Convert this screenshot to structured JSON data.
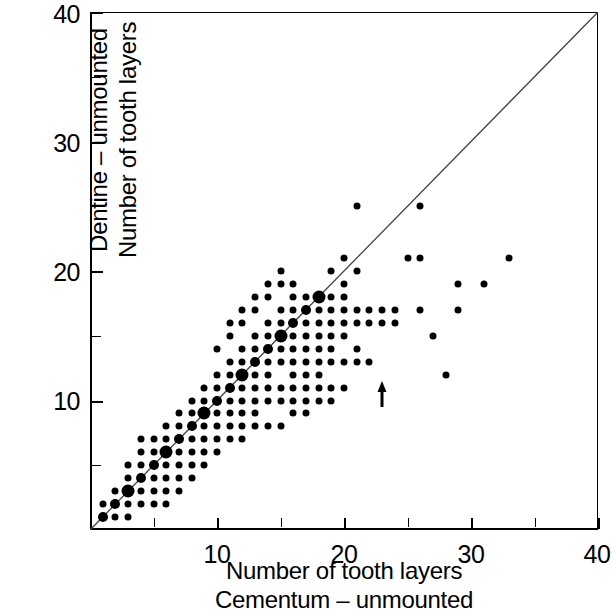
{
  "chart_data": {
    "type": "scatter",
    "title": "",
    "xlabel": "Number of tooth layers / Cementum - unmounted",
    "ylabel": "Dentine - unmounted / Number of tooth layers",
    "xlim": [
      0,
      40
    ],
    "ylim": [
      0,
      40
    ],
    "grid": false,
    "legend": null,
    "x_tick_labels": [
      "10",
      "20",
      "30",
      "40"
    ],
    "x_tick_values": [
      10,
      20,
      30,
      40
    ],
    "y_tick_labels": [
      "10",
      "20",
      "30",
      "40"
    ],
    "y_tick_values": [
      10,
      20,
      30,
      40
    ],
    "minor_tick_interval": 5,
    "reference_line": {
      "name": "identity-line",
      "type": "line",
      "from": [
        0,
        0
      ],
      "to": [
        40,
        40
      ],
      "color": "#444444"
    },
    "annotations": [
      {
        "name": "censored-arrow",
        "symbol": "up-arrow",
        "x": 23,
        "y": 10.5
      }
    ],
    "point_color": "#000000",
    "points": [
      [
        1,
        1
      ],
      [
        1,
        2
      ],
      [
        2,
        1
      ],
      [
        2,
        2
      ],
      [
        2,
        3
      ],
      [
        3,
        2
      ],
      [
        3,
        3
      ],
      [
        3,
        4
      ],
      [
        4,
        3
      ],
      [
        4,
        4
      ],
      [
        4,
        5
      ],
      [
        5,
        4
      ],
      [
        5,
        5
      ],
      [
        5,
        6
      ],
      [
        5,
        3
      ],
      [
        6,
        5
      ],
      [
        6,
        6
      ],
      [
        6,
        7
      ],
      [
        6,
        4
      ],
      [
        7,
        6
      ],
      [
        7,
        7
      ],
      [
        7,
        8
      ],
      [
        7,
        5
      ],
      [
        8,
        7
      ],
      [
        8,
        8
      ],
      [
        8,
        9
      ],
      [
        8,
        6
      ],
      [
        9,
        8
      ],
      [
        9,
        9
      ],
      [
        9,
        10
      ],
      [
        9,
        7
      ],
      [
        10,
        9
      ],
      [
        10,
        10
      ],
      [
        10,
        11
      ],
      [
        10,
        8
      ],
      [
        11,
        10
      ],
      [
        11,
        11
      ],
      [
        11,
        12
      ],
      [
        11,
        9
      ],
      [
        12,
        11
      ],
      [
        12,
        12
      ],
      [
        12,
        13
      ],
      [
        12,
        10
      ],
      [
        13,
        12
      ],
      [
        13,
        13
      ],
      [
        13,
        14
      ],
      [
        13,
        11
      ],
      [
        14,
        13
      ],
      [
        14,
        14
      ],
      [
        14,
        15
      ],
      [
        14,
        12
      ],
      [
        15,
        14
      ],
      [
        15,
        15
      ],
      [
        15,
        16
      ],
      [
        15,
        13
      ],
      [
        16,
        15
      ],
      [
        16,
        16
      ],
      [
        16,
        17
      ],
      [
        16,
        14
      ],
      [
        17,
        16
      ],
      [
        17,
        17
      ],
      [
        17,
        18
      ],
      [
        17,
        15
      ],
      [
        18,
        17
      ],
      [
        18,
        18
      ],
      [
        18,
        16
      ],
      [
        19,
        18
      ],
      [
        19,
        17
      ],
      [
        20,
        19
      ],
      [
        20,
        18
      ],
      [
        21,
        20
      ],
      [
        21,
        25
      ],
      [
        22,
        17
      ],
      [
        23,
        17
      ],
      [
        24,
        17
      ],
      [
        25,
        21
      ],
      [
        26,
        25
      ],
      [
        26,
        17
      ],
      [
        26,
        21
      ],
      [
        27,
        15
      ],
      [
        28,
        12
      ],
      [
        29,
        19
      ],
      [
        29,
        17
      ],
      [
        33,
        21
      ],
      [
        31,
        19
      ],
      [
        4,
        6
      ],
      [
        5,
        7
      ],
      [
        6,
        8
      ],
      [
        7,
        9
      ],
      [
        8,
        10
      ],
      [
        9,
        11
      ],
      [
        10,
        12
      ],
      [
        11,
        13
      ],
      [
        12,
        14
      ],
      [
        13,
        15
      ],
      [
        14,
        16
      ],
      [
        15,
        17
      ],
      [
        16,
        18
      ],
      [
        12,
        16
      ],
      [
        13,
        17
      ],
      [
        14,
        18
      ],
      [
        15,
        19
      ],
      [
        11,
        15
      ],
      [
        10,
        14
      ],
      [
        13,
        9
      ],
      [
        14,
        10
      ],
      [
        15,
        11
      ],
      [
        16,
        12
      ],
      [
        17,
        13
      ],
      [
        18,
        14
      ],
      [
        12,
        8
      ],
      [
        16,
        11
      ],
      [
        17,
        11
      ],
      [
        18,
        11
      ],
      [
        19,
        11
      ],
      [
        20,
        11
      ],
      [
        15,
        10
      ],
      [
        16,
        10
      ],
      [
        17,
        10
      ],
      [
        18,
        10
      ],
      [
        19,
        10
      ],
      [
        12,
        9
      ],
      [
        13,
        10
      ],
      [
        14,
        11
      ],
      [
        9,
        6
      ],
      [
        10,
        7
      ],
      [
        11,
        8
      ],
      [
        6,
        3
      ],
      [
        7,
        4
      ],
      [
        8,
        5
      ],
      [
        3,
        5
      ],
      [
        4,
        7
      ],
      [
        18,
        13
      ],
      [
        19,
        13
      ],
      [
        20,
        13
      ],
      [
        21,
        13
      ],
      [
        16,
        13
      ],
      [
        17,
        14
      ],
      [
        18,
        15
      ],
      [
        19,
        16
      ],
      [
        20,
        17
      ],
      [
        21,
        17
      ],
      [
        22,
        13
      ],
      [
        20,
        15
      ],
      [
        19,
        15
      ],
      [
        18,
        12
      ],
      [
        17,
        12
      ],
      [
        16,
        19
      ],
      [
        15,
        20
      ],
      [
        14,
        19
      ],
      [
        13,
        18
      ],
      [
        12,
        17
      ],
      [
        11,
        16
      ],
      [
        20,
        21
      ],
      [
        19,
        20
      ],
      [
        21,
        16
      ],
      [
        22,
        16
      ],
      [
        23,
        16
      ],
      [
        24,
        16
      ],
      [
        14,
        8
      ],
      [
        15,
        8
      ],
      [
        13,
        8
      ],
      [
        17,
        9
      ],
      [
        16,
        9
      ],
      [
        12,
        7
      ],
      [
        11,
        7
      ],
      [
        10,
        6
      ],
      [
        8,
        4
      ],
      [
        9,
        5
      ],
      [
        7,
        3
      ],
      [
        5,
        2
      ],
      [
        6,
        2
      ],
      [
        4,
        2
      ],
      [
        3,
        1
      ],
      [
        20,
        16
      ],
      [
        19,
        14
      ],
      [
        21,
        14
      ]
    ]
  },
  "axis_titles": {
    "y_line1": "Dentine – unmounted",
    "y_line2": "Number of tooth layers",
    "x_line1": "Number of tooth layers",
    "x_line2": "Cementum – unmounted"
  }
}
